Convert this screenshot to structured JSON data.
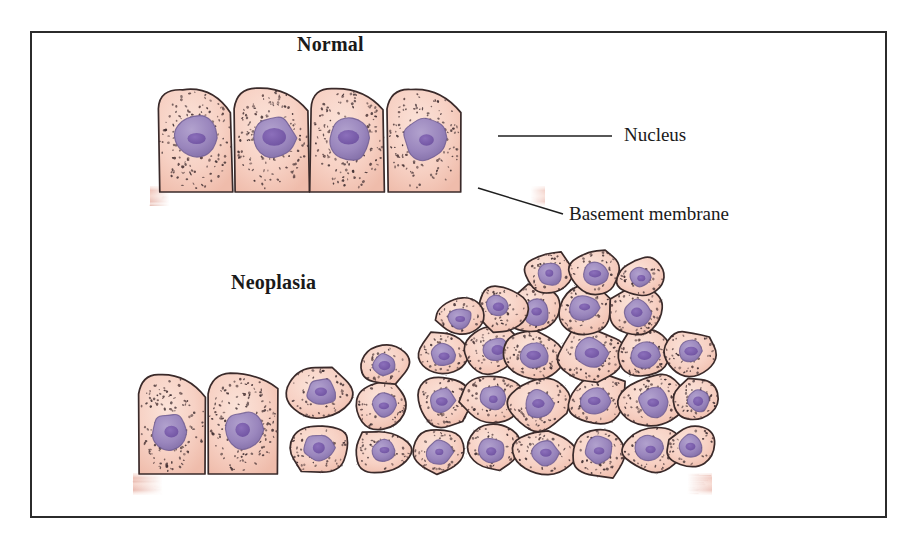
{
  "figure": {
    "domain_kind": "histology-illustration",
    "frame": {
      "x": 30,
      "y": 31,
      "width": 857,
      "height": 487,
      "border_color": "#2b2b2b",
      "background": "#ffffff"
    },
    "titles": {
      "normal": "Normal",
      "neoplasia": "Neoplasia"
    },
    "labels": {
      "nucleus": "Nucleus",
      "basement_membrane": "Basement membrane"
    },
    "leader_lines": [
      {
        "name": "nucleus-leader",
        "x1": 498,
        "y1": 136,
        "x2": 612,
        "y2": 136
      },
      {
        "name": "basement-membrane-leader",
        "x1": 478,
        "y1": 188,
        "x2": 563,
        "y2": 214
      }
    ],
    "colors": {
      "cytoplasm_fill": "#f6cdc0",
      "cytoplasm_fill_light": "#fadfd5",
      "cytoplasm_edge": "#3a2a2a",
      "speckle": "#5a4242",
      "speckle_dark": "#3e2d30",
      "nucleus_fill": "#9f8cc0",
      "nucleus_edge": "#6d5a90",
      "nucleolus_fill": "#7b5ea8",
      "basement_membrane": "#e09b8c",
      "basement_membrane_light": "#f3c6ba",
      "leader_line": "#1f1f1f",
      "text": "#1a1a1a",
      "frame": "#2b2b2b"
    }
  },
  "chart_data": {
    "type": "diagram",
    "panels": [
      {
        "name": "normal",
        "label": "Normal",
        "description": "Single orderly row of uniform columnar epithelial cells resting on an intact basement membrane",
        "cell_count": 4,
        "layers": 1,
        "basement_membrane_intact": true,
        "cells": [
          {
            "id": "n1",
            "cx": 196,
            "cy": 140,
            "w": 74,
            "h": 104,
            "nucleus_cx": 195,
            "nucleus_cy": 138,
            "nucleus_r": 22
          },
          {
            "id": "n2",
            "cx": 272,
            "cy": 140,
            "w": 74,
            "h": 104,
            "nucleus_cx": 271,
            "nucleus_cy": 138,
            "nucleus_r": 22
          },
          {
            "id": "n3",
            "cx": 348,
            "cy": 140,
            "w": 74,
            "h": 104,
            "nucleus_cx": 347,
            "nucleus_cy": 138,
            "nucleus_r": 22
          },
          {
            "id": "n4",
            "cx": 424,
            "cy": 140,
            "w": 74,
            "h": 104,
            "nucleus_cx": 423,
            "nucleus_cy": 138,
            "nucleus_r": 22
          }
        ],
        "basement_membrane": {
          "x1": 150,
          "x2": 545,
          "y": 196,
          "thickness": 20
        }
      },
      {
        "name": "neoplasia",
        "label": "Neoplasia",
        "description": "Progressive loss of polarity with crowded, pleomorphic cells piling into a multilayered mound; basement membrane still present beneath",
        "cell_count": 38,
        "layers_range": [
          1,
          5
        ],
        "basement_membrane_intact": true,
        "basement_membrane": {
          "x1": 133,
          "x2": 712,
          "y": 484,
          "thickness": 22
        }
      }
    ],
    "annotations": [
      {
        "label": "Nucleus",
        "points_to": "nucleus of fourth normal cell",
        "anchor_x": 498,
        "anchor_y": 136
      },
      {
        "label": "Basement membrane",
        "points_to": "basement membrane beneath normal epithelium",
        "anchor_x": 478,
        "anchor_y": 188
      }
    ]
  }
}
